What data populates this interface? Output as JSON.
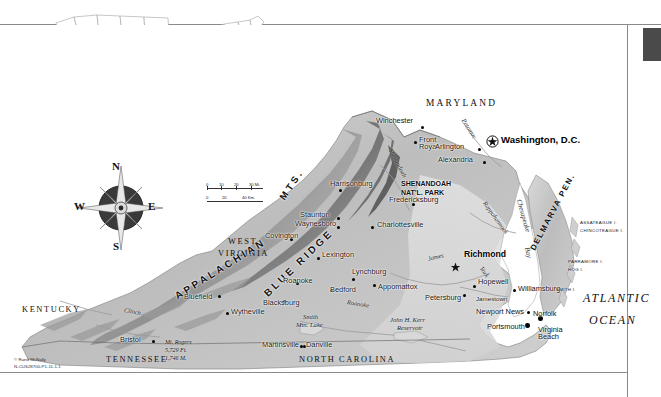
{
  "document": {
    "type": "reference-map",
    "subject": "Virginia",
    "credit_line1": "© Rand McNally",
    "credit_line2": "N-CUS28700-P1-11-1-1"
  },
  "inset": {
    "name": "united-states-locator-map",
    "highlighted_state": "Virginia"
  },
  "compass": {
    "north": "N",
    "south": "S",
    "east": "E",
    "west": "W"
  },
  "scale": {
    "miles_ticks": [
      "0",
      "10",
      "20",
      "30 Mi."
    ],
    "km_ticks": [
      "0",
      "20",
      "40 Km."
    ]
  },
  "capitals": [
    {
      "name": "Washington, D.C.",
      "symbol": "star-in-circle",
      "x": 497,
      "y": 140
    },
    {
      "name": "Richmond",
      "symbol": "star",
      "x": 472,
      "y": 256
    }
  ],
  "cities": [
    {
      "name": "Winchester",
      "x": 399,
      "y": 120
    },
    {
      "name": "Front Royal",
      "x": 423,
      "y": 142
    },
    {
      "name": "Arlington",
      "x": 458,
      "y": 146
    },
    {
      "name": "Alexandria",
      "x": 462,
      "y": 159
    },
    {
      "name": "Harrisonburg",
      "x": 334,
      "y": 183
    },
    {
      "name": "Fredericksburg",
      "x": 414,
      "y": 197
    },
    {
      "name": "Staunton",
      "x": 327,
      "y": 213
    },
    {
      "name": "Waynesboro",
      "x": 324,
      "y": 222
    },
    {
      "name": "Charlottesville",
      "x": 394,
      "y": 223
    },
    {
      "name": "Covington",
      "x": 294,
      "y": 235
    },
    {
      "name": "Lexington",
      "x": 338,
      "y": 254
    },
    {
      "name": "Lynchburg",
      "x": 350,
      "y": 272
    },
    {
      "name": "Appomattox",
      "x": 377,
      "y": 287
    },
    {
      "name": "Bedford",
      "x": 332,
      "y": 288
    },
    {
      "name": "Hopewell",
      "x": 478,
      "y": 280
    },
    {
      "name": "Petersburg",
      "x": 430,
      "y": 295
    },
    {
      "name": "Jamestown",
      "x": 471,
      "y": 299
    },
    {
      "name": "Williamsburg",
      "x": 510,
      "y": 286
    },
    {
      "name": "Roanoke",
      "x": 289,
      "y": 282
    },
    {
      "name": "Blacksburg",
      "x": 269,
      "y": 299
    },
    {
      "name": "Bluefield",
      "x": 183,
      "y": 295
    },
    {
      "name": "Wytheville",
      "x": 223,
      "y": 309
    },
    {
      "name": "Martinsville",
      "x": 266,
      "y": 343
    },
    {
      "name": "Danville",
      "x": 309,
      "y": 343
    },
    {
      "name": "Bristol",
      "x": 122,
      "y": 338
    },
    {
      "name": "Newport News",
      "x": 495,
      "y": 310
    },
    {
      "name": "Norfolk",
      "x": 536,
      "y": 312
    },
    {
      "name": "Portsmouth",
      "x": 492,
      "y": 325
    },
    {
      "name": "Virginia Beach",
      "x": 557,
      "y": 321
    }
  ],
  "states": [
    {
      "name": "MARYLAND",
      "x": 460,
      "y": 104
    },
    {
      "name": "WEST",
      "x": 232,
      "y": 243
    },
    {
      "name": "VIRGINIA",
      "x": 224,
      "y": 254
    },
    {
      "name": "KENTUCKY",
      "x": 55,
      "y": 311
    },
    {
      "name": "TENNESSEE",
      "x": 98,
      "y": 360
    },
    {
      "name": "NORTH CAROLINA",
      "x": 303,
      "y": 360
    }
  ],
  "regions": [
    {
      "name": "APPALACHIAN",
      "x": 170,
      "y": 300
    },
    {
      "name": "MTS.",
      "x": 295,
      "y": 200
    },
    {
      "name": "BLUE RIDGE",
      "x": 270,
      "y": 270
    },
    {
      "name": "DELMARVA PEN.",
      "x": 560,
      "y": 215
    }
  ],
  "parks": [
    {
      "line1": "SHENANDOAH",
      "line2": "NAT'L. PARK",
      "x": 404,
      "y": 185
    }
  ],
  "water": [
    {
      "name": "Potomac",
      "x": 466,
      "y": 123
    },
    {
      "name": "Shenandoah",
      "x": 400,
      "y": 152
    },
    {
      "name": "Rappahannock",
      "x": 490,
      "y": 209
    },
    {
      "name": "James",
      "x": 436,
      "y": 257
    },
    {
      "name": "York",
      "x": 485,
      "y": 268
    },
    {
      "name": "Roanoke",
      "x": 357,
      "y": 303
    },
    {
      "name": "Clinch",
      "x": 131,
      "y": 311
    },
    {
      "name": "Chesapeake",
      "x": 530,
      "y": 206
    },
    {
      "name": "Bay",
      "x": 540,
      "y": 240
    }
  ],
  "lakes": [
    {
      "line1": "Smith",
      "line2": "Mtn. Lake",
      "x": 320,
      "y": 320
    },
    {
      "line1": "John H. Kerr",
      "line2": "Reservoir",
      "x": 405,
      "y": 322
    }
  ],
  "islands": [
    {
      "name": "ASSATEAGUE I.",
      "x": 592,
      "y": 224
    },
    {
      "name": "CHINCOTEAGUE I.",
      "x": 592,
      "y": 232
    },
    {
      "name": "PARRAMORE I.",
      "x": 580,
      "y": 262
    },
    {
      "name": "HOG I.",
      "x": 580,
      "y": 270
    },
    {
      "name": "SMITH I.",
      "x": 570,
      "y": 289
    }
  ],
  "ocean": {
    "line1": "ATLANTIC",
    "line2": "OCEAN",
    "x": 590,
    "y": 300
  },
  "peak": {
    "name": "Mt. Rogers",
    "elev_ft": "5,729 Ft.",
    "elev_m": "1,746 M.",
    "x": 170,
    "y": 343
  }
}
